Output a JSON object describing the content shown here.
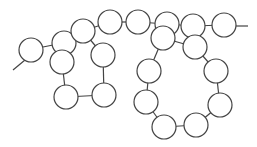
{
  "diagram": {
    "type": "bead-chain-graph",
    "colors": {
      "stroke": "#444444",
      "fill": "#ffffff",
      "background": "#ffffff"
    },
    "node_radius": 12,
    "nodes": [
      {
        "id": "n1",
        "x": 31,
        "y": 50
      },
      {
        "id": "n2",
        "x": 64,
        "y": 43
      },
      {
        "id": "n3",
        "x": 62,
        "y": 62
      },
      {
        "id": "n4",
        "x": 83,
        "y": 31
      },
      {
        "id": "n5",
        "x": 103,
        "y": 55
      },
      {
        "id": "n6",
        "x": 110,
        "y": 22
      },
      {
        "id": "n7",
        "x": 66,
        "y": 97
      },
      {
        "id": "n8",
        "x": 104,
        "y": 95
      },
      {
        "id": "n9",
        "x": 138,
        "y": 22
      },
      {
        "id": "n10",
        "x": 167,
        "y": 24
      },
      {
        "id": "n11",
        "x": 163,
        "y": 38
      },
      {
        "id": "n12",
        "x": 193,
        "y": 26
      },
      {
        "id": "n13",
        "x": 195,
        "y": 47
      },
      {
        "id": "n14",
        "x": 224,
        "y": 25
      },
      {
        "id": "n15",
        "x": 149,
        "y": 71
      },
      {
        "id": "n16",
        "x": 216,
        "y": 71
      },
      {
        "id": "n17",
        "x": 146,
        "y": 102
      },
      {
        "id": "n18",
        "x": 220,
        "y": 105
      },
      {
        "id": "n19",
        "x": 164,
        "y": 127
      },
      {
        "id": "n20",
        "x": 196,
        "y": 125
      }
    ],
    "edges": [
      {
        "x1": 13,
        "y1": 70,
        "x2": 25,
        "y2": 60
      },
      {
        "x1": 43,
        "y1": 47,
        "x2": 53,
        "y2": 45
      },
      {
        "x1": 62,
        "y1": 62,
        "x2": 66,
        "y2": 97
      },
      {
        "x1": 66,
        "y1": 97,
        "x2": 104,
        "y2": 95
      },
      {
        "x1": 104,
        "y1": 95,
        "x2": 103,
        "y2": 55
      },
      {
        "x1": 83,
        "y1": 31,
        "x2": 103,
        "y2": 55
      },
      {
        "x1": 83,
        "y1": 31,
        "x2": 110,
        "y2": 22
      },
      {
        "x1": 110,
        "y1": 22,
        "x2": 138,
        "y2": 22
      },
      {
        "x1": 138,
        "y1": 22,
        "x2": 167,
        "y2": 24
      },
      {
        "x1": 167,
        "y1": 24,
        "x2": 193,
        "y2": 26
      },
      {
        "x1": 193,
        "y1": 26,
        "x2": 224,
        "y2": 25
      },
      {
        "x1": 236,
        "y1": 26,
        "x2": 248,
        "y2": 26
      },
      {
        "x1": 163,
        "y1": 38,
        "x2": 149,
        "y2": 71
      },
      {
        "x1": 149,
        "y1": 71,
        "x2": 146,
        "y2": 102
      },
      {
        "x1": 146,
        "y1": 102,
        "x2": 164,
        "y2": 127
      },
      {
        "x1": 164,
        "y1": 127,
        "x2": 196,
        "y2": 125
      },
      {
        "x1": 196,
        "y1": 125,
        "x2": 220,
        "y2": 105
      },
      {
        "x1": 220,
        "y1": 105,
        "x2": 216,
        "y2": 71
      },
      {
        "x1": 216,
        "y1": 71,
        "x2": 195,
        "y2": 47
      },
      {
        "x1": 163,
        "y1": 38,
        "x2": 195,
        "y2": 47
      }
    ]
  }
}
